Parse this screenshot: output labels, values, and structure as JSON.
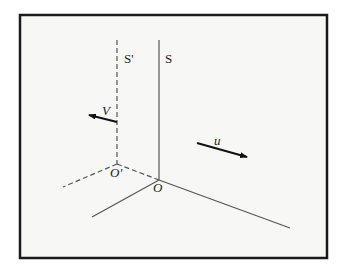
{
  "diagram": {
    "frame": {
      "x": 20,
      "y": 15,
      "width": 307,
      "height": 243,
      "stroke": "#1a1a1a",
      "fill": "#f7f7f5"
    },
    "labels": {
      "frame_s_prime": "S'",
      "frame_s": "S",
      "origin_prime": "O'",
      "origin": "O",
      "velocity_v": "V",
      "velocity_u": "u"
    },
    "colors": {
      "line": "#555555",
      "arrow": "#111111",
      "text": "#222222"
    }
  }
}
